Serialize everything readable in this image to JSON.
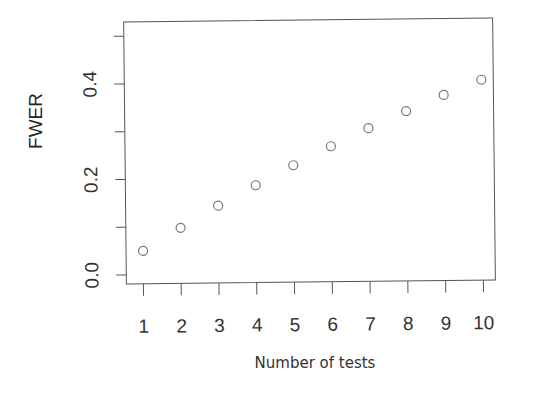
{
  "chart_data": {
    "type": "scatter",
    "title": "",
    "xlabel": "Number of tests",
    "ylabel": "FWER",
    "x": [
      1,
      2,
      3,
      4,
      5,
      6,
      7,
      8,
      9,
      10
    ],
    "series": [
      {
        "name": "FWER",
        "marker": "open-circle",
        "values": [
          0.05,
          0.0975,
          0.143,
          0.185,
          0.226,
          0.265,
          0.302,
          0.337,
          0.37,
          0.401
        ]
      }
    ],
    "xticks": [
      "1",
      "2",
      "3",
      "4",
      "5",
      "6",
      "7",
      "8",
      "9",
      "10"
    ],
    "yticks": [
      0.0,
      0.1,
      0.2,
      0.3,
      0.4,
      0.5
    ],
    "ytick_labels": [
      "0.0",
      "0.2",
      "0.4"
    ],
    "xlim": [
      0.6,
      10.4
    ],
    "ylim": [
      -0.02,
      0.52
    ],
    "grid": false,
    "legend": null
  },
  "colors": {
    "axis": "#555555",
    "marker": "#777777",
    "text": "#333333"
  }
}
